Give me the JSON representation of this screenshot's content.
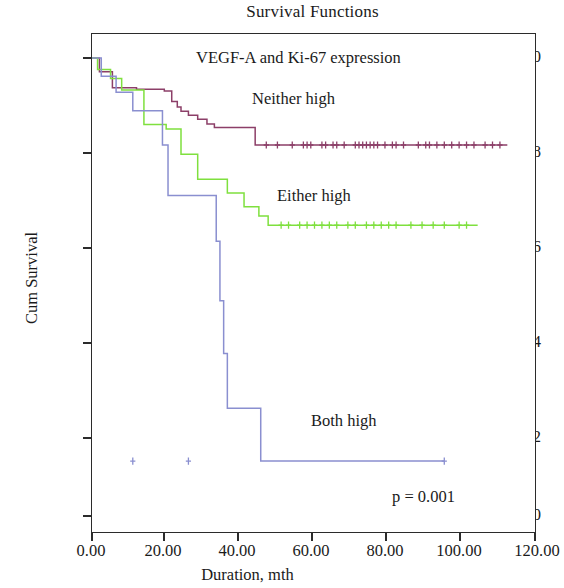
{
  "chart_data": {
    "type": "line",
    "subtype": "kaplan-meier-step",
    "title": "Survival Functions",
    "subtitle": "VEGF-A and Ki-67 expression",
    "xlabel": "Duration, mth",
    "ylabel": "Cum Survival",
    "xlim": [
      0,
      120
    ],
    "ylim": [
      0.0,
      1.0
    ],
    "xticks": [
      0,
      20,
      40,
      60,
      80,
      100,
      120
    ],
    "xtick_labels": [
      "0.00",
      "20.00",
      "40.00",
      "60.00",
      "80.00",
      "100.00",
      "120.00"
    ],
    "yticks": [
      0.0,
      0.2,
      0.4,
      0.6,
      0.8,
      1.0
    ],
    "ytick_labels": [
      "0.0",
      "0.2",
      "0.4",
      "0.6",
      "0.8",
      "1.0"
    ],
    "grid": false,
    "legend_position": "inline-annotations",
    "annotations": [
      {
        "name": "p-value",
        "text": "p = 0.001",
        "x": 104,
        "y": 0.045
      }
    ],
    "series": [
      {
        "name": "Neither high",
        "color": "#8c3f68",
        "label_x": 66,
        "label_y": 0.9,
        "final_survival": 0.81,
        "steps": [
          [
            0.0,
            1.0
          ],
          [
            2.0,
            1.0
          ],
          [
            2.0,
            0.97
          ],
          [
            5.5,
            0.97
          ],
          [
            5.5,
            0.935
          ],
          [
            12.0,
            0.935
          ],
          [
            12.0,
            0.932
          ],
          [
            19.5,
            0.932
          ],
          [
            19.5,
            0.928
          ],
          [
            21.5,
            0.928
          ],
          [
            21.5,
            0.905
          ],
          [
            23.0,
            0.905
          ],
          [
            23.0,
            0.893
          ],
          [
            24.0,
            0.893
          ],
          [
            24.0,
            0.884
          ],
          [
            26.0,
            0.884
          ],
          [
            26.0,
            0.875
          ],
          [
            28.5,
            0.875
          ],
          [
            28.5,
            0.866
          ],
          [
            31.0,
            0.866
          ],
          [
            31.0,
            0.856
          ],
          [
            33.0,
            0.856
          ],
          [
            33.0,
            0.848
          ],
          [
            44.0,
            0.848
          ],
          [
            44.0,
            0.81
          ],
          [
            112.0,
            0.81
          ]
        ],
        "censor_times": [
          47,
          50,
          54,
          57,
          58,
          59,
          62,
          63,
          65,
          66,
          68,
          71,
          72,
          73,
          74,
          75,
          76,
          77,
          79,
          81,
          82,
          84,
          88,
          90,
          91,
          93,
          95,
          97,
          99,
          101,
          103,
          106,
          108,
          110
        ],
        "censor_value": 0.81
      },
      {
        "name": "Either high",
        "color": "#7fe03e",
        "label_x": 74,
        "label_y": 0.69,
        "final_survival": 0.635,
        "steps": [
          [
            0.0,
            1.0
          ],
          [
            1.5,
            1.0
          ],
          [
            1.5,
            0.975
          ],
          [
            5.0,
            0.975
          ],
          [
            5.0,
            0.955
          ],
          [
            8.0,
            0.955
          ],
          [
            8.0,
            0.93
          ],
          [
            14.0,
            0.93
          ],
          [
            14.0,
            0.855
          ],
          [
            20.0,
            0.855
          ],
          [
            20.0,
            0.845
          ],
          [
            24.0,
            0.845
          ],
          [
            24.0,
            0.79
          ],
          [
            28.5,
            0.79
          ],
          [
            28.5,
            0.735
          ],
          [
            36.5,
            0.735
          ],
          [
            36.5,
            0.705
          ],
          [
            41.0,
            0.705
          ],
          [
            41.0,
            0.675
          ],
          [
            45.0,
            0.675
          ],
          [
            45.0,
            0.655
          ],
          [
            47.5,
            0.655
          ],
          [
            47.5,
            0.635
          ],
          [
            104.0,
            0.635
          ]
        ],
        "censor_times": [
          51,
          53,
          56,
          58,
          60,
          62,
          64,
          66,
          69,
          71,
          74,
          76,
          78,
          80,
          82,
          86,
          89,
          92,
          95,
          99,
          101
        ],
        "censor_value": 0.635
      },
      {
        "name": "Both high",
        "color": "#8a8fd0",
        "label_x": 62,
        "label_y": 0.195,
        "final_survival": 0.12,
        "steps": [
          [
            0.0,
            1.0
          ],
          [
            2.5,
            1.0
          ],
          [
            2.5,
            0.96
          ],
          [
            6.5,
            0.96
          ],
          [
            6.5,
            0.925
          ],
          [
            11.0,
            0.925
          ],
          [
            11.0,
            0.885
          ],
          [
            19.0,
            0.885
          ],
          [
            19.0,
            0.81
          ],
          [
            20.5,
            0.81
          ],
          [
            20.5,
            0.7
          ],
          [
            33.5,
            0.7
          ],
          [
            33.5,
            0.6
          ],
          [
            34.5,
            0.6
          ],
          [
            34.5,
            0.47
          ],
          [
            35.5,
            0.47
          ],
          [
            35.5,
            0.355
          ],
          [
            36.5,
            0.355
          ],
          [
            36.5,
            0.235
          ],
          [
            37.0,
            0.235
          ],
          [
            37.0,
            0.235
          ],
          [
            37.0,
            0.235
          ],
          [
            45.5,
            0.235
          ],
          [
            45.5,
            0.12
          ],
          [
            95.0,
            0.12
          ]
        ],
        "censor_times": [
          11,
          26,
          95
        ],
        "censor_value": null
      }
    ]
  },
  "header": {
    "title": "Survival Functions"
  },
  "plot": {
    "subtitle": "VEGF-A and Ki-67 expression",
    "pvalue": "p = 0.001"
  },
  "axes": {
    "x_title": "Duration, mth",
    "y_title": "Cum Survival"
  },
  "labels": {
    "neither": "Neither high",
    "either": "Either high",
    "both": "Both high"
  }
}
